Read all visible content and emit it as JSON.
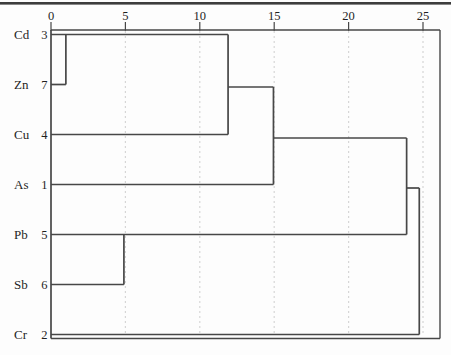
{
  "chart_data": {
    "type": "dendrogram",
    "orientation": "horizontal",
    "title": "",
    "axis": {
      "position": "top",
      "min": 0,
      "max": 26.1,
      "tick_labels": [
        "0",
        "5",
        "10",
        "15",
        "20",
        "25"
      ],
      "tick_values": [
        0,
        5,
        10,
        15,
        20,
        25
      ],
      "gridline_values": [
        5,
        10,
        15,
        20,
        25
      ],
      "grid_style": "dashed"
    },
    "leaves": [
      {
        "label": "Cd",
        "case": "3"
      },
      {
        "label": "Zn",
        "case": "7"
      },
      {
        "label": "Cu",
        "case": "4"
      },
      {
        "label": "As",
        "case": "1"
      },
      {
        "label": "Pb",
        "case": "5"
      },
      {
        "label": "Sb",
        "case": "6"
      },
      {
        "label": "Cr",
        "case": "2"
      }
    ],
    "merges": [
      {
        "members": [
          "Cd",
          "Zn"
        ],
        "distance": 1.0
      },
      {
        "members": [
          "Pb",
          "Sb"
        ],
        "distance": 4.9
      },
      {
        "members": [
          "Cd",
          "Zn",
          "Cu"
        ],
        "distance": 11.9
      },
      {
        "members": [
          "Cd",
          "Zn",
          "Cu",
          "As"
        ],
        "distance": 14.95
      },
      {
        "members": [
          "Cd",
          "Zn",
          "Cu",
          "As",
          "Pb",
          "Sb"
        ],
        "distance": 23.9
      },
      {
        "members": [
          "Cd",
          "Zn",
          "Cu",
          "As",
          "Pb",
          "Sb",
          "Cr"
        ],
        "distance": 24.75
      }
    ],
    "segments": {
      "h": [
        {
          "row": 0,
          "x1": 0,
          "x2": 11.9
        },
        {
          "row": 1,
          "x1": 0,
          "x2": 1.0
        },
        {
          "row": 2,
          "x1": 0,
          "x2": 11.9
        },
        {
          "row": 3,
          "x1": 0,
          "x2": 14.95
        },
        {
          "row": 4,
          "x1": 0,
          "x2": 23.9
        },
        {
          "row": 5,
          "x1": 0,
          "x2": 4.9
        },
        {
          "row": 6,
          "x1": 0,
          "x2": 24.75
        },
        {
          "row": 1.05,
          "x1": 11.9,
          "x2": 14.95
        },
        {
          "row": 2.07,
          "x1": 14.95,
          "x2": 23.9
        },
        {
          "row": 3.07,
          "x1": 23.9,
          "x2": 24.75
        }
      ],
      "v": [
        {
          "x": 1.0,
          "row1": 0,
          "row2": 1
        },
        {
          "x": 4.9,
          "row1": 4,
          "row2": 5
        },
        {
          "x": 11.9,
          "row1": 0,
          "row2": 2
        },
        {
          "x": 14.95,
          "row1": 1.05,
          "row2": 3
        },
        {
          "x": 23.9,
          "row1": 2.07,
          "row2": 4
        },
        {
          "x": 24.75,
          "row1": 3.07,
          "row2": 6
        }
      ]
    },
    "colors": {
      "line": "#474747",
      "border": "#474747",
      "top_rule": "#3d3d3d",
      "grid": "#d6d6d6",
      "text": "#1f1f1f",
      "background": "#fdfdfd"
    }
  }
}
